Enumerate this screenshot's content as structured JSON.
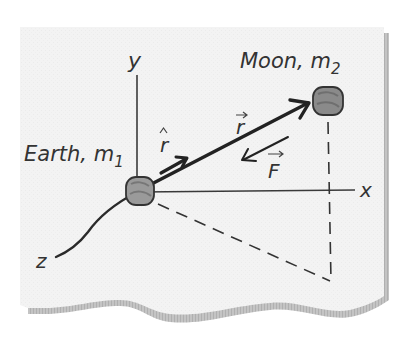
{
  "diagram": {
    "axes": {
      "x_label": "x",
      "y_label": "y",
      "z_label": "z"
    },
    "earth": {
      "name": "Earth, m",
      "subscript": "1"
    },
    "moon": {
      "name": "Moon, m",
      "subscript": "2"
    },
    "vectors": {
      "unit_r": "r",
      "position_r": "r",
      "force_F": "F"
    },
    "colors": {
      "paper": "#f2f2f2",
      "paper_shadow": "#b8b8b8",
      "ink": "#2a2a2a",
      "body_fill": "#8c8c8c"
    }
  }
}
